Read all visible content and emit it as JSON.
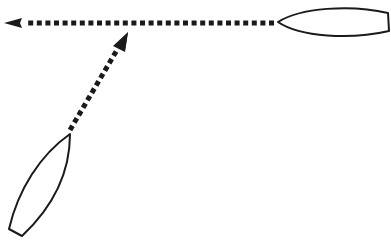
{
  "diagram": {
    "title": "",
    "background": "#ffffff",
    "stroke_color": "#1a1a1a",
    "elements": [
      {
        "id": "boat-a",
        "type": "boat-hull",
        "orientation": "pointing-left",
        "bow": [
          278,
          22
        ],
        "stern": [
          389,
          22
        ]
      },
      {
        "id": "boat-b",
        "type": "boat-hull",
        "orientation": "pointing-up-right",
        "bow": [
          70,
          134
        ],
        "stern": [
          15,
          232
        ]
      },
      {
        "id": "arrow-a",
        "type": "dotted-arrow",
        "from": [
          276,
          23
        ],
        "to": [
          4,
          23
        ],
        "label": ""
      },
      {
        "id": "arrow-b",
        "type": "dotted-arrow",
        "from": [
          70,
          132
        ],
        "to": [
          128,
          32
        ],
        "label": ""
      }
    ]
  }
}
